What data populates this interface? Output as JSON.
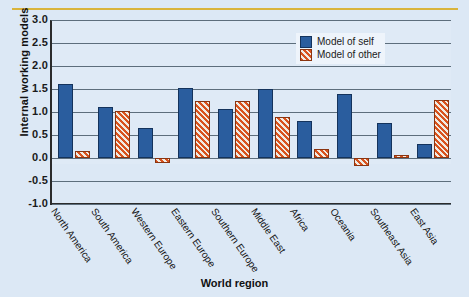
{
  "chart_data": {
    "type": "bar",
    "title": "",
    "xlabel": "World region",
    "ylabel": "Internal working models",
    "ylim": [
      -1.0,
      3.0
    ],
    "ytick_labels": [
      "3.0",
      "2.5",
      "2.0",
      "1.5",
      "1.0",
      "0.5",
      "0.0",
      "-0.5",
      "-1.0"
    ],
    "ytick_values": [
      3.0,
      2.5,
      2.0,
      1.5,
      1.0,
      0.5,
      0.0,
      -0.5,
      -1.0
    ],
    "grid": true,
    "legend_position": "top-right",
    "categories": [
      "North America",
      "South America",
      "Western Europe",
      "Eastern Europe",
      "Southern Europe",
      "Middle East",
      "Africa",
      "Oceania",
      "Southeast Asia",
      "East Asia"
    ],
    "series": [
      {
        "name": "Model of self",
        "color": "#2a5d9e",
        "values": [
          1.6,
          1.11,
          0.66,
          1.52,
          1.07,
          1.49,
          0.81,
          1.4,
          0.77,
          0.31
        ]
      },
      {
        "name": "Model of other",
        "color": "#d9531e",
        "values": [
          0.15,
          1.02,
          -0.1,
          1.25,
          1.25,
          0.9,
          0.2,
          -0.17,
          0.06,
          1.26
        ]
      }
    ]
  },
  "legend": {
    "items": [
      {
        "label": "Model of self"
      },
      {
        "label": "Model of other"
      }
    ]
  },
  "colors": {
    "self": "#2a5d9e",
    "other": "#d9531e",
    "background": "#dce8f5",
    "rule": "#d9b43c",
    "axis": "#2b2b2b",
    "gridline": "#5d6e7c"
  }
}
